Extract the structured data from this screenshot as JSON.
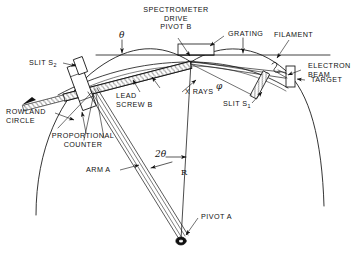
{
  "figure": {
    "kind": "technical-line-diagram",
    "background_color": "#ffffff",
    "ink_color": "#111111"
  },
  "labels": {
    "spectrometer_drive_pivot_b": "SPECTROMETER\nDRIVE\nPIVOT B",
    "grating": "GRATING",
    "filament": "FILAMENT",
    "electron_beam": "ELECTRON\nBEAM",
    "target": "TARGET",
    "slit_s1_text": "SLIT S",
    "slit_s1_sub": "1",
    "slit_s2_text": "SLIT S",
    "slit_s2_sub": "2",
    "x_rays": "X RAYS",
    "lead_screw_b": "LEAD\nSCREW B",
    "rowland_circle": "ROWLAND\nCIRCLE",
    "proportional_counter": "PROPORTIONAL\nCOUNTER",
    "arm_a": "ARM A",
    "pivot_a": "PIVOT A"
  },
  "symbols": {
    "theta": "θ",
    "two_theta": "2θ",
    "phi": "φ",
    "radius": "R"
  },
  "geometry": {
    "pivot_b": {
      "x": 191,
      "y": 65
    },
    "pivot_a": {
      "x": 180,
      "y": 240
    },
    "counter_center": {
      "x": 86,
      "y": 86
    },
    "slit_s1": {
      "x": 260,
      "y": 85
    },
    "target": {
      "x": 291,
      "y": 76
    },
    "horizontal_axis_y": 55,
    "rowland_radius_label": "R"
  }
}
